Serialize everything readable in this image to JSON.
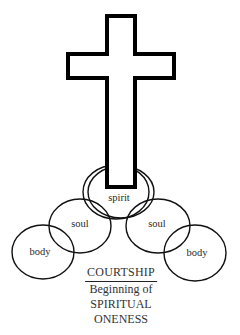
{
  "diagram": {
    "colors": {
      "stroke": "#111111",
      "background": "#ffffff",
      "text": "#2a2a2a"
    },
    "cross": {
      "icon": "cross-icon"
    },
    "labels": {
      "spirit": "spirit",
      "soul_left": "soul",
      "soul_right": "soul",
      "body_left": "body",
      "body_right": "body"
    },
    "caption": {
      "title": "COURTSHIP",
      "line1": "Beginning of",
      "line2": "SPIRITUAL",
      "line3": "ONENESS"
    }
  }
}
